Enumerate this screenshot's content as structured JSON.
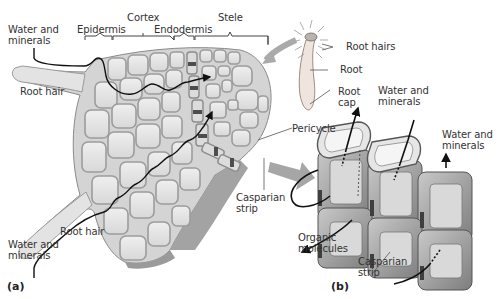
{
  "figure": {
    "panels": {
      "a": "(a)",
      "b": "(b)"
    },
    "labels": {
      "water_minerals_top_left": [
        "Water and",
        "minerals"
      ],
      "epidermis": "Epidermis",
      "cortex": "Cortex",
      "endodermis": "Endodermis",
      "stele": "Stele",
      "root_hair_top": "Root hair",
      "root_hair_bottom": "Root hair",
      "water_minerals_bottom_left": [
        "Water and",
        "minerals"
      ],
      "root_hairs": "Root hairs",
      "root": "Root",
      "root_cap": [
        "Root",
        "cap"
      ],
      "pericycle": "Pericycle",
      "casparian_strip_a": [
        "Casparian",
        "strip"
      ],
      "water_minerals_b1": [
        "Water and",
        "minerals"
      ],
      "water_minerals_b2": [
        "Water and",
        "minerals"
      ],
      "organic_molecules": [
        "Organic",
        "molecules"
      ],
      "casparian_strip_b": [
        "Casparian",
        "strip"
      ]
    },
    "colors": {
      "cell_wall": "#a8a8a8",
      "cell_fill": "#e6e6e6",
      "cell_inner": "#f2f2f2",
      "casparian": "#555555",
      "pathway": "#111111",
      "arrow_fill": "#9a9a9a",
      "text": "#333333"
    }
  }
}
